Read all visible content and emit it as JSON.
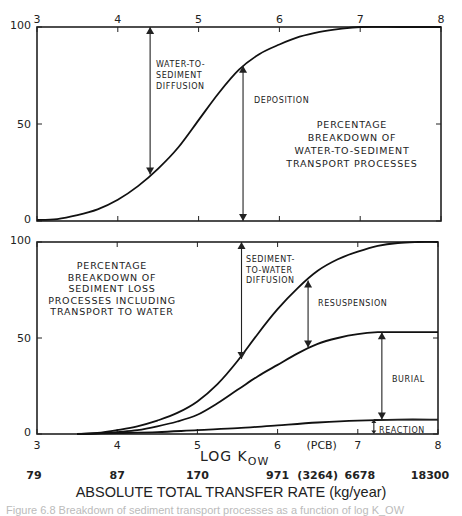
{
  "chart_data": [
    {
      "type": "line",
      "panel": "top",
      "title": "",
      "xlabel": "",
      "ylabel": "",
      "xlim": [
        3,
        8
      ],
      "ylim": [
        0,
        100
      ],
      "x_ticks": [
        "3",
        "4",
        "5",
        "6",
        "7",
        "8"
      ],
      "y_ticks": [
        "0",
        "50",
        "100"
      ],
      "x_tick_position": "top",
      "grid": false,
      "series": [
        {
          "name": "Deposition boundary",
          "x": [
            3.0,
            3.25,
            3.5,
            3.75,
            4.0,
            4.25,
            4.5,
            4.75,
            5.0,
            5.25,
            5.5,
            5.75,
            6.0,
            6.25,
            6.5,
            6.75,
            7.0,
            7.5,
            8.0
          ],
          "values": [
            0.5,
            1,
            3,
            6,
            11,
            18,
            27,
            38,
            52,
            66,
            78,
            86,
            91,
            95,
            97.5,
            99,
            100,
            100,
            100
          ]
        }
      ],
      "annotations": [
        {
          "text": [
            "WATER-TO-",
            "SEDIMENT",
            "DIFFUSION"
          ],
          "arrow_x": 4.4,
          "arrow_from": 100,
          "arrow_to": 24
        },
        {
          "text": [
            "DEPOSITION"
          ],
          "arrow_x": 5.55,
          "arrow_from": 80,
          "arrow_to": 0
        }
      ],
      "panel_label": [
        "PERCENTAGE",
        "BREAKDOWN OF",
        "WATER-TO-SEDIMENT",
        "TRANSPORT PROCESSES"
      ]
    },
    {
      "type": "line",
      "panel": "bottom",
      "title": "",
      "xlabel": "LOG K",
      "xlabel_subscript": "OW",
      "ylabel": "",
      "xlim": [
        3,
        8
      ],
      "ylim": [
        0,
        100
      ],
      "x_ticks": [
        "3",
        "4",
        "5",
        "6",
        "7",
        "8"
      ],
      "y_ticks": [
        "0",
        "50",
        "100"
      ],
      "extra_x_label": {
        "text": "(PCB)",
        "x": 6.55
      },
      "grid": false,
      "series": [
        {
          "name": "Sediment-to-water diffusion / resuspension boundary",
          "x": [
            3.5,
            3.75,
            4.0,
            4.25,
            4.5,
            4.75,
            5.0,
            5.25,
            5.5,
            5.75,
            6.0,
            6.25,
            6.5,
            6.75,
            7.0,
            7.25,
            7.5,
            7.75,
            8.0
          ],
          "values": [
            0,
            0.5,
            2,
            4,
            7,
            11,
            17,
            26,
            38,
            52,
            65,
            76,
            85,
            91,
            95,
            98,
            99.5,
            100,
            100
          ]
        },
        {
          "name": "Resuspension / burial boundary",
          "x": [
            3.5,
            3.75,
            4.0,
            4.25,
            4.5,
            4.75,
            5.0,
            5.25,
            5.5,
            5.75,
            6.0,
            6.25,
            6.5,
            6.75,
            7.0,
            7.25,
            7.5,
            7.75,
            8.0
          ],
          "values": [
            0,
            0.3,
            1,
            2,
            4,
            6.5,
            10,
            16,
            23,
            30,
            36,
            42,
            47,
            50,
            52,
            53,
            53,
            53,
            53
          ]
        },
        {
          "name": "Burial / reaction boundary",
          "x": [
            3.5,
            4.0,
            4.5,
            5.0,
            5.5,
            6.0,
            6.5,
            7.0,
            7.5,
            8.0
          ],
          "values": [
            0,
            0.5,
            1,
            2,
            3,
            4.5,
            6,
            7,
            7.5,
            7.5
          ]
        }
      ],
      "annotations": [
        {
          "text": [
            "SEDIMENT-",
            "TO-WATER",
            "DIFFUSION"
          ],
          "arrow_x": 5.55,
          "arrow_from": 100,
          "arrow_to": 39
        },
        {
          "text": [
            "RESUSPENSION"
          ],
          "arrow_x": 6.38,
          "arrow_from": 80,
          "arrow_to": 45
        },
        {
          "text": [
            "BURIAL"
          ],
          "arrow_x": 7.3,
          "arrow_from": 53,
          "arrow_to": 7.5
        },
        {
          "text": [
            "REACTION"
          ],
          "arrow_x": 7.2,
          "arrow_from": 7.5,
          "arrow_to": 0
        }
      ],
      "panel_label": [
        "PERCENTAGE",
        "BREAKDOWN OF",
        "SEDIMENT LOSS",
        "PROCESSES INCLUDING",
        "TRANSPORT TO WATER"
      ]
    }
  ],
  "secondary_axis": {
    "title": "ABSOLUTE TOTAL TRANSFER RATE (kg/year)",
    "labels": [
      {
        "x": 3.0,
        "text": "79"
      },
      {
        "x": 4.0,
        "text": "87"
      },
      {
        "x": 5.0,
        "text": "170"
      },
      {
        "x": 6.0,
        "text": "971"
      },
      {
        "x": 6.55,
        "text": "(3264)"
      },
      {
        "x": 7.0,
        "text": "6678"
      },
      {
        "x": 8.0,
        "text": "18300"
      }
    ]
  },
  "caption": "Figure 6.8   Breakdown of sediment transport processes as a function of log K_OW"
}
